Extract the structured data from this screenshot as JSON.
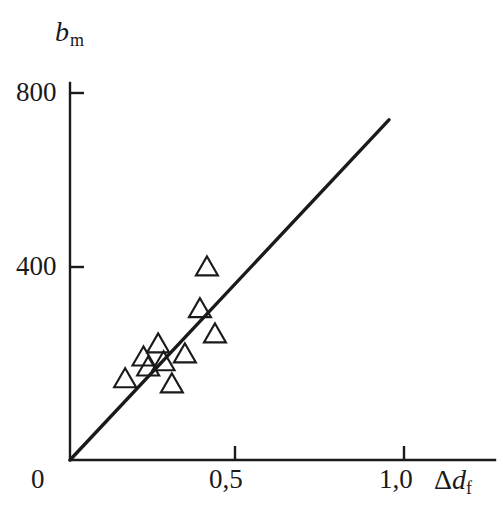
{
  "figure": {
    "background": "#ffffff",
    "ink_color": "#1a1a1a"
  },
  "axes": {
    "y_label": {
      "symbol": "b",
      "subscript": "m"
    },
    "x_label": {
      "prefix": "Δ",
      "symbol": "d",
      "subscript": "f"
    },
    "y_ticks": [
      {
        "value": 400,
        "label": "400"
      },
      {
        "value": 800,
        "label": "800"
      }
    ],
    "x_ticks": [
      {
        "value": 0,
        "label": "0"
      },
      {
        "value": 0.5,
        "label": "0,5"
      },
      {
        "value": 1.0,
        "label": "1,0"
      }
    ]
  },
  "chart_data": {
    "type": "scatter",
    "title": "",
    "xlabel": "Δd_f",
    "ylabel": "b_m",
    "xlim": [
      0,
      1.15
    ],
    "ylim": [
      0,
      870
    ],
    "grid": false,
    "legend": null,
    "series": [
      {
        "name": "measurements",
        "marker": "triangle-up-open",
        "points": [
          {
            "x": 0.165,
            "y": 184
          },
          {
            "x": 0.22,
            "y": 234
          },
          {
            "x": 0.234,
            "y": 211
          },
          {
            "x": 0.264,
            "y": 264
          },
          {
            "x": 0.28,
            "y": 223
          },
          {
            "x": 0.305,
            "y": 172
          },
          {
            "x": 0.344,
            "y": 241
          },
          {
            "x": 0.389,
            "y": 345
          },
          {
            "x": 0.41,
            "y": 441
          },
          {
            "x": 0.434,
            "y": 287
          }
        ]
      },
      {
        "name": "fit-line",
        "type": "line",
        "x_start": 0.0,
        "y_start": 0,
        "x_end": 0.955,
        "y_end": 782
      }
    ]
  }
}
